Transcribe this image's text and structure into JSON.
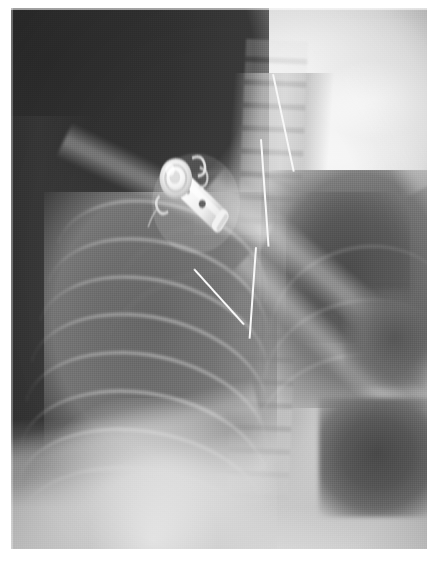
{
  "document": {
    "kind": "radiograph",
    "modality": "X-ray",
    "view": "chest, frontal (AP) — upper thorax and neck",
    "orientation": "patient right on image left",
    "title": "Chest radiograph"
  },
  "canvas": {
    "width_px": 441,
    "height_px": 566,
    "border_color": "#ffffff",
    "border": {
      "left_px": 11,
      "top_px": 8,
      "right_px": 14,
      "bottom_px": 17
    }
  },
  "film": {
    "left_px": 11,
    "top_px": 8,
    "width_px": 416,
    "height_px": 541,
    "background_color": "#3a3a3a",
    "tone_range": {
      "darkest": "#2f2f2f",
      "brightest": "#ffffff"
    }
  },
  "regions": [
    {
      "name": "air-background-upper-left",
      "label": "Exposed background / off-patient air",
      "tone": "#343434",
      "x_pct": 0,
      "y_pct": 0,
      "w_pct": 58,
      "h_pct": 40
    },
    {
      "name": "neck-soft-tissue",
      "label": "Neck and shoulder soft tissue (overexposed bright)",
      "tone": "#f7f7f7",
      "x_pct": 52,
      "y_pct": 0,
      "w_pct": 48,
      "h_pct": 30
    },
    {
      "name": "cervical-spine",
      "label": "Cervical / upper thoracic vertebrae",
      "tone": "#c6c6c6",
      "x_pct": 54,
      "y_pct": 2,
      "w_pct": 18,
      "h_pct": 28
    },
    {
      "name": "right-lung-field",
      "label": "Right lung field with rib arcs",
      "tone": "#6f6f6f",
      "x_pct": 6,
      "y_pct": 32,
      "w_pct": 54,
      "h_pct": 52
    },
    {
      "name": "left-lung-field",
      "label": "Left lung field / cardiac silhouette",
      "tone": "#5c5c5c",
      "x_pct": 60,
      "y_pct": 28,
      "w_pct": 40,
      "h_pct": 44
    },
    {
      "name": "mediastinum",
      "label": "Mediastinum and thoracic spine column",
      "tone": "#bdbdbd",
      "x_pct": 50,
      "y_pct": 10,
      "w_pct": 24,
      "h_pct": 80
    },
    {
      "name": "gastric-gas-bubble",
      "label": "Gas lucency below left hemidiaphragm",
      "tone": "#505050",
      "x_pct": 74,
      "y_pct": 70,
      "w_pct": 28,
      "h_pct": 22
    },
    {
      "name": "diaphragm-abdomen",
      "label": "Hemidiaphragms and upper abdomen",
      "tone": "#e8e8e8",
      "x_pct": 0,
      "y_pct": 76,
      "w_pct": 100,
      "h_pct": 24
    }
  ],
  "ribs": {
    "label": "Posterior and anterior rib arcs, right hemithorax",
    "count": 8,
    "tone_cortex": "#e8e8e8",
    "arcs": [
      {
        "left_pct": 10,
        "top_pct": 36,
        "w_pct": 52,
        "h_pct": 26,
        "rot_deg": 16
      },
      {
        "left_pct": 8,
        "top_pct": 43,
        "w_pct": 54,
        "h_pct": 26,
        "rot_deg": 15
      },
      {
        "left_pct": 6,
        "top_pct": 50,
        "w_pct": 56,
        "h_pct": 26,
        "rot_deg": 14
      },
      {
        "left_pct": 4,
        "top_pct": 57,
        "w_pct": 58,
        "h_pct": 27,
        "rot_deg": 13
      },
      {
        "left_pct": 3,
        "top_pct": 64,
        "w_pct": 59,
        "h_pct": 27,
        "rot_deg": 12
      },
      {
        "left_pct": 2,
        "top_pct": 71,
        "w_pct": 60,
        "h_pct": 28,
        "rot_deg": 11
      },
      {
        "left_pct": 1,
        "top_pct": 78,
        "w_pct": 61,
        "h_pct": 28,
        "rot_deg": 10
      },
      {
        "left_pct": 1,
        "top_pct": 85,
        "w_pct": 62,
        "h_pct": 28,
        "rot_deg": 9
      }
    ],
    "posterior_arcs": [
      {
        "left_pct": 26,
        "top_pct": 30,
        "w_pct": 50,
        "h_pct": 30,
        "rot_deg": -8
      },
      {
        "left_pct": 24,
        "top_pct": 39,
        "w_pct": 54,
        "h_pct": 30,
        "rot_deg": -7
      },
      {
        "left_pct": 22,
        "top_pct": 48,
        "w_pct": 58,
        "h_pct": 31,
        "rot_deg": -6
      }
    ],
    "left_arcs": [
      {
        "left_pct": 62,
        "top_pct": 44,
        "w_pct": 46,
        "h_pct": 30,
        "rot_deg": -16
      },
      {
        "left_pct": 60,
        "top_pct": 54,
        "w_pct": 48,
        "h_pct": 30,
        "rot_deg": -15
      },
      {
        "left_pct": 58,
        "top_pct": 64,
        "w_pct": 50,
        "h_pct": 30,
        "rot_deg": -14
      }
    ]
  },
  "bands": {
    "label": "Bright linear shadows: clavicle, scapular border, diaphragm edge",
    "items": [
      {
        "name": "clavicle-right",
        "left_pct": 10,
        "top_pct": 30,
        "w_pct": 54,
        "h_pct": 7,
        "rot_deg": 26,
        "opacity": 0.55
      },
      {
        "name": "scapula-edge-left",
        "left_pct": 40,
        "top_pct": 46,
        "w_pct": 72,
        "h_pct": 8,
        "rot_deg": 40,
        "opacity": 0.6
      },
      {
        "name": "scapula-edge-lower",
        "left_pct": 46,
        "top_pct": 62,
        "w_pct": 70,
        "h_pct": 7,
        "rot_deg": 44,
        "opacity": 0.5
      },
      {
        "name": "diaphragm-edge-right",
        "left_pct": -2,
        "top_pct": 74,
        "w_pct": 62,
        "h_pct": 9,
        "rot_deg": -14,
        "opacity": 0.45
      },
      {
        "name": "humerus-shaft-left",
        "left_pct": 74,
        "top_pct": 18,
        "w_pct": 34,
        "h_pct": 8,
        "rot_deg": 62,
        "opacity": 0.4
      }
    ]
  },
  "catheter": {
    "label": "Radiopaque catheter tubing descending from device into mediastinum",
    "tone": "#f6f6f6",
    "segments": [
      {
        "name": "upper-neck-limb",
        "left_pct": 63,
        "top_pct": 12,
        "len_pct": 24,
        "thick_px": 2,
        "rot_deg": 78
      },
      {
        "name": "mid-limb",
        "left_pct": 60,
        "top_pct": 24,
        "len_pct": 26,
        "thick_px": 2,
        "rot_deg": 86
      },
      {
        "name": "descending-limb",
        "left_pct": 59,
        "top_pct": 44,
        "len_pct": 22,
        "thick_px": 2,
        "rot_deg": 94
      },
      {
        "name": "device-exit-limb",
        "left_pct": 44,
        "top_pct": 48,
        "len_pct": 18,
        "thick_px": 2,
        "rot_deg": 48
      }
    ]
  },
  "device": {
    "name": "implanted-vascular-access-port",
    "label": "Metallic implanted device / port with catheter hub",
    "location": "right infraclavicular region",
    "tone_metal": "#fbfbfb",
    "tone_shadow": "#9e9e9e",
    "orientation_deg": 38,
    "features": [
      {
        "name": "hub-disc",
        "label": "Circular reservoir / hub"
      },
      {
        "name": "suture-loop-1",
        "label": "Wire suture loop (superior)"
      },
      {
        "name": "suture-loop-2",
        "label": "Wire suture loop (lateral)"
      },
      {
        "name": "body-shaft",
        "label": "Tapered device body"
      },
      {
        "name": "side-port-hole",
        "label": "Radiolucent side aperture"
      },
      {
        "name": "distal-tip",
        "label": "Distal tip band"
      }
    ]
  }
}
